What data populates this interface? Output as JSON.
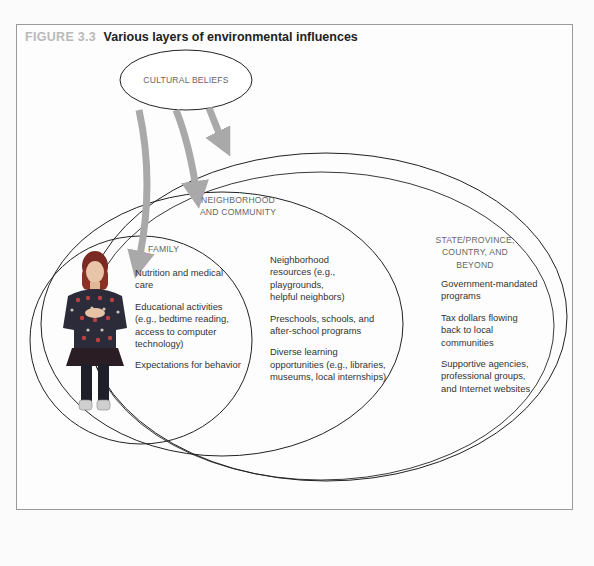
{
  "figure": {
    "number": "FIGURE 3.3",
    "title": "Various layers of environmental influences"
  },
  "layers": {
    "cultural": {
      "label": "CULTURAL BELIEFS"
    },
    "family": {
      "label": "FAMILY",
      "items": [
        "Nutrition and medical care",
        "Educational activities (e.g., bedtime reading, access to computer technology)",
        "Expectations for behavior"
      ]
    },
    "neighborhood": {
      "label_line1": "NEIGHBORHOOD",
      "label_line2": "AND COMMUNITY",
      "items": [
        "Neighborhood resources (e.g., playgrounds, helpful neighbors)",
        "Preschools, schools, and after-school programs",
        "Diverse learning opportunities (e.g., libraries, museums, local internships)"
      ]
    },
    "state": {
      "label_line1": "STATE/PROVINCE,",
      "label_line2": "COUNTRY, AND BEYOND",
      "items": [
        "Government-mandated programs",
        "Tax dollars flowing back to local communities",
        "Supportive agencies, professional groups, and Internet websites"
      ]
    }
  },
  "colors": {
    "arrow": "#a9a9a9",
    "outline": "#222222",
    "figure_number": "#b9b9b9"
  },
  "illustration": {
    "subject": "child-in-patterned-sweater"
  }
}
